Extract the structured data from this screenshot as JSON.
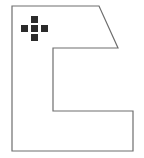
{
  "canvas": {
    "width": 144,
    "height": 158,
    "background_color": "#ffffff",
    "label": "shape-canvas"
  },
  "shape": {
    "name": "c-shaped-polygon",
    "stroke_color": "#6e6e6e",
    "stroke_width": 1.2,
    "fill_color": "none",
    "points": "12,6 99,6 118,48 53,48 53,111 133,111 133,151 12,151",
    "vertices": [
      {
        "x": 12,
        "y": 6,
        "label": "top-left-corner"
      },
      {
        "x": 99,
        "y": 6,
        "label": "top-edge-end"
      },
      {
        "x": 118,
        "y": 48,
        "label": "diagonal-end"
      },
      {
        "x": 53,
        "y": 48,
        "label": "notch-top-left"
      },
      {
        "x": 53,
        "y": 111,
        "label": "notch-bottom-left"
      },
      {
        "x": 133,
        "y": 111,
        "label": "notch-bottom-right"
      },
      {
        "x": 133,
        "y": 151,
        "label": "bottom-right-corner"
      },
      {
        "x": 12,
        "y": 151,
        "label": "bottom-left-corner"
      }
    ]
  },
  "cursor": {
    "name": "move-cursor-icon",
    "type": "plus-cross",
    "color": "#2b2b2b",
    "cell_size": 7,
    "center_x": 31,
    "center_y": 26,
    "cells": [
      {
        "x": 31,
        "y": 16,
        "label": "cursor-cell-top"
      },
      {
        "x": 21,
        "y": 25,
        "label": "cursor-cell-left"
      },
      {
        "x": 31,
        "y": 25,
        "label": "cursor-cell-center"
      },
      {
        "x": 41,
        "y": 25,
        "label": "cursor-cell-right"
      },
      {
        "x": 31,
        "y": 34,
        "label": "cursor-cell-bottom"
      }
    ]
  }
}
